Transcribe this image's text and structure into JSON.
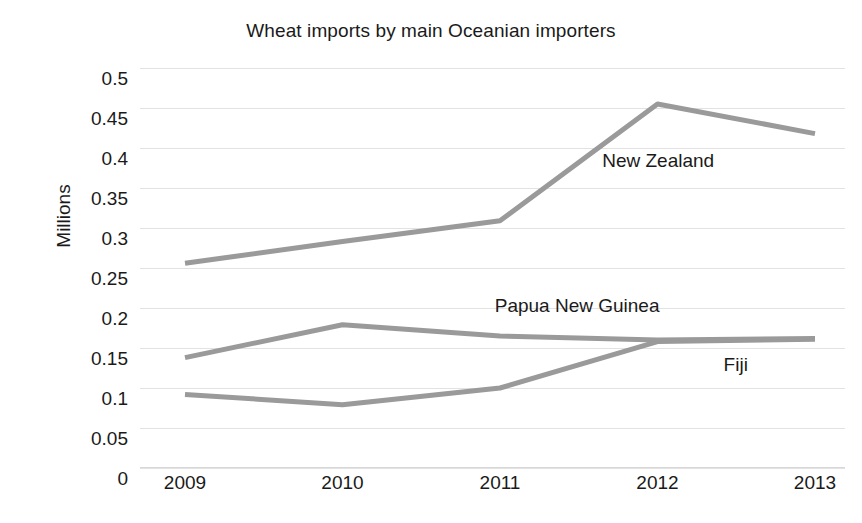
{
  "chart_data": {
    "type": "line",
    "title": "Wheat imports by main Oceanian importers",
    "xlabel": "",
    "ylabel": "Millions",
    "categories": [
      "2009",
      "2010",
      "2011",
      "2012",
      "2013"
    ],
    "x": [
      2009,
      2010,
      2011,
      2012,
      2013
    ],
    "ylim": [
      0,
      0.5
    ],
    "yticks": [
      "0",
      "0.05",
      "0.1",
      "0.15",
      "0.2",
      "0.25",
      "0.3",
      "0.35",
      "0.4",
      "0.45",
      "0.5"
    ],
    "ytick_values": [
      0,
      0.05,
      0.1,
      0.15,
      0.2,
      0.25,
      0.3,
      0.35,
      0.4,
      0.45,
      0.5
    ],
    "grid": true,
    "legend_position": "inline-right",
    "series": [
      {
        "name": "New Zealand",
        "values": [
          0.256,
          0.283,
          0.309,
          0.455,
          0.418
        ],
        "color": "#9a9a9a",
        "label_x_pct": 73.5,
        "label_y_px": 82
      },
      {
        "name": "Papua New Guinea",
        "values": [
          0.138,
          0.179,
          0.165,
          0.16,
          0.162
        ],
        "color": "#9a9a9a",
        "label_x_pct": 62.0,
        "label_y_px": 227
      },
      {
        "name": "Fiji",
        "values": [
          0.092,
          0.079,
          0.1,
          0.158,
          0.161
        ],
        "color": "#9a9a9a",
        "label_x_pct": 84.5,
        "label_y_px": 286
      }
    ]
  }
}
